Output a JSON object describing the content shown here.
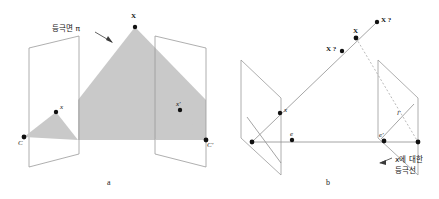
{
  "figure": {
    "background_color": "#ffffff",
    "shade_color": "#c9c9c9",
    "line_color": "#9a9a9a",
    "point_color": "#111111"
  },
  "panel_a": {
    "caption": "a",
    "annotation": {
      "text": "등극면 π",
      "meaning": "epipolar-plane-pi"
    },
    "labels": {
      "scene_point": "X",
      "left_image_point": "x",
      "left_camera_center": "C",
      "right_image_point": "x′",
      "right_camera_center": "C′"
    }
  },
  "panel_b": {
    "caption": "b",
    "annotation": {
      "line1": "x에 대한",
      "line2": "등극선",
      "meaning": "epipolar-line-for-x"
    },
    "labels": {
      "scene_point": "X",
      "candidate_point_far": "X ?",
      "candidate_point_near": "X ?",
      "left_image_point": "x",
      "left_epipole": "e",
      "right_epipole": "e′",
      "right_epipolar_line": "l′"
    }
  }
}
